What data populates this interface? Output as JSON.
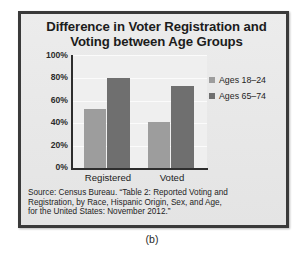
{
  "figure": {
    "caption": "(b)"
  },
  "chart_data": {
    "type": "bar",
    "title": "Difference in Voter Registration and Voting between Age Groups",
    "title_lines": [
      "Difference in Voter Registration and",
      "Voting between Age Groups"
    ],
    "xlabel": "",
    "ylabel": "",
    "categories": [
      "Registered",
      "Voted"
    ],
    "series": [
      {
        "name": "Ages 18–24",
        "values": [
          53,
          41
        ],
        "color": "#9d9d9d"
      },
      {
        "name": "Ages 65–74",
        "values": [
          80,
          73
        ],
        "color": "#6f6f6f"
      }
    ],
    "ylim": [
      0,
      100
    ],
    "yticks": [
      0,
      20,
      40,
      60,
      80,
      100
    ],
    "ytick_labels": [
      "0%",
      "20%",
      "40%",
      "60%",
      "80%",
      "100%"
    ],
    "value_suffix": "%",
    "grid": true,
    "grid_axis": "y",
    "legend_position": "right",
    "plot_background": "#efefef",
    "panel_background": "#e9e9e9",
    "axis_color": "#2e2e2e",
    "source_note": "Source: Census Bureau. “Table 2: Reported Voting and Registration, by Race, Hispanic Origin, Sex, and Age, for the United States: November 2012.”",
    "source_note_lines": [
      "Source: Census Bureau. “Table 2: Reported Voting and",
      "Registration, by Race, Hispanic Origin, Sex, and Age,",
      "for the United States: November 2012.”"
    ]
  }
}
